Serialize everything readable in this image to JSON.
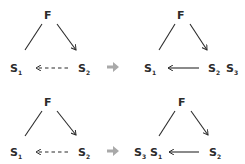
{
  "diagram": {
    "transition_arrow_color": "#a9a9a9",
    "ink_color": "#2b2b2b",
    "rows": [
      {
        "before": {
          "nodes": {
            "top": "F",
            "left": "S",
            "left_sub": "1",
            "right": "S",
            "right_sub": "2"
          },
          "edges": [
            {
              "from": "F",
              "to": "S1",
              "style": "solid",
              "directed": false
            },
            {
              "from": "F",
              "to": "S2",
              "style": "solid",
              "directed": true
            },
            {
              "from": "S2",
              "to": "S1",
              "style": "dashed",
              "directed": true
            }
          ]
        },
        "after": {
          "nodes": {
            "top": "F",
            "left": "S",
            "left_sub": "1",
            "right": "S",
            "right_sub": "2",
            "extra": "S",
            "extra_sub": "3",
            "extra_position": "right"
          },
          "edges": [
            {
              "from": "F",
              "to": "S1",
              "style": "solid",
              "directed": false
            },
            {
              "from": "F",
              "to": "S2",
              "style": "solid",
              "directed": true
            },
            {
              "from": "S2",
              "to": "S1",
              "style": "solid",
              "directed": true
            }
          ]
        }
      },
      {
        "before": {
          "nodes": {
            "top": "F",
            "left": "S",
            "left_sub": "1",
            "right": "S",
            "right_sub": "2"
          },
          "edges": [
            {
              "from": "F",
              "to": "S1",
              "style": "solid",
              "directed": false
            },
            {
              "from": "F",
              "to": "S2",
              "style": "solid",
              "directed": true
            },
            {
              "from": "S2",
              "to": "S1",
              "style": "dashed",
              "directed": true
            }
          ]
        },
        "after": {
          "nodes": {
            "top": "F",
            "left": "S",
            "left_sub": "1",
            "right": "S",
            "right_sub": "2",
            "extra": "S",
            "extra_sub": "3",
            "extra_position": "left"
          },
          "edges": [
            {
              "from": "F",
              "to": "S1",
              "style": "solid",
              "directed": false
            },
            {
              "from": "F",
              "to": "S2",
              "style": "solid",
              "directed": true
            },
            {
              "from": "S2",
              "to": "S1",
              "style": "solid",
              "directed": true
            }
          ]
        }
      }
    ]
  }
}
